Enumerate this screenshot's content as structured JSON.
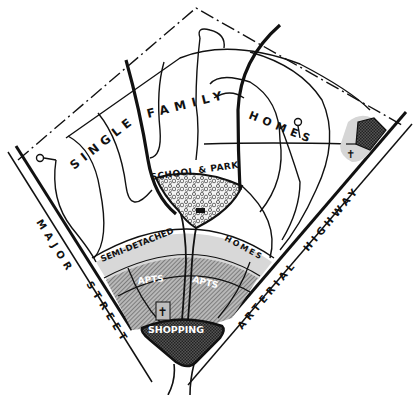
{
  "diagram": {
    "type": "neighborhood-plan",
    "colors": {
      "ink": "#111111",
      "paper": "#ffffff",
      "light_band": "#d6d6d6",
      "mid_band": "#9a9a9a",
      "dark_fill": "#3a3a3a",
      "park_fill": "#e8e8e8"
    },
    "zones": {
      "single_family": "SINGLE FAMILY HOMES",
      "single_word1": "SINGLE",
      "single_word2": "FAMILY",
      "single_word3": "HOMES",
      "school_park": "SCHOOL & PARK",
      "semi_detached": "SEMI-DETACHED",
      "semi_homes": "HOMES",
      "apts_left": "APTS",
      "apts_right": "APTS",
      "shopping": "SHOPPING"
    },
    "roads": {
      "major_street": "MAJOR STREET",
      "major_word1": "MAJOR",
      "major_word2": "STREET",
      "arterial_highway": "ARTERIAL HIGHWAY",
      "arterial_word1": "ARTERIAL",
      "arterial_word2": "HIGHWAY"
    },
    "symbols": {
      "church_center": "church-cross",
      "church_right": "church-cross",
      "school_building": "school-building",
      "cul_de_sacs": 2
    }
  }
}
